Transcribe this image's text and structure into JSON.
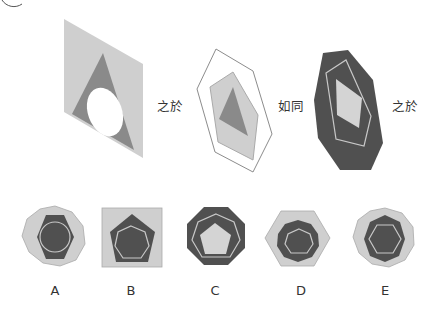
{
  "colors": {
    "light": "#cfcfcf",
    "mid": "#8a8a8a",
    "dark": "#505050",
    "white": "#ffffff",
    "outline_dark": "#8c8c8c",
    "outline_light": "#c8c8c8"
  },
  "analogy": {
    "connector_1": "之於",
    "connector_2": "如同",
    "connector_3": "之於"
  },
  "options": [
    {
      "label": "A",
      "description": "light nonagon, dark hexagon, light circle outline"
    },
    {
      "label": "B",
      "description": "light square, dark pentagon, light heptagon outline"
    },
    {
      "label": "C",
      "description": "dark octagon, light heptagon outline, light pentagon"
    },
    {
      "label": "D",
      "description": "light hexagon, dark decagon, light heptagon outline"
    },
    {
      "label": "E",
      "description": "light nonagon, dark heptagon, light hexagon outline"
    }
  ]
}
